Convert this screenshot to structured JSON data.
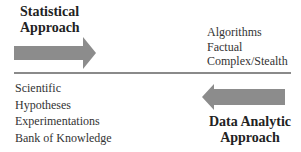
{
  "top_left": {
    "title_lines": [
      "Statistical",
      "Approach"
    ],
    "arrow": {
      "direction": "right",
      "color": "#8c8c8c"
    }
  },
  "top_right": {
    "items": [
      "Algorithms",
      "Factual",
      "Complex/Stealth"
    ]
  },
  "divider": {
    "color": "#8a8a8a"
  },
  "bottom_left": {
    "items": [
      "Scientific",
      "Hypotheses",
      "Experimentations",
      "Bank of Knowledge"
    ]
  },
  "bottom_right": {
    "title_lines": [
      "Data Analytic",
      "Approach"
    ],
    "arrow": {
      "direction": "left",
      "color": "#8c8c8c"
    }
  }
}
